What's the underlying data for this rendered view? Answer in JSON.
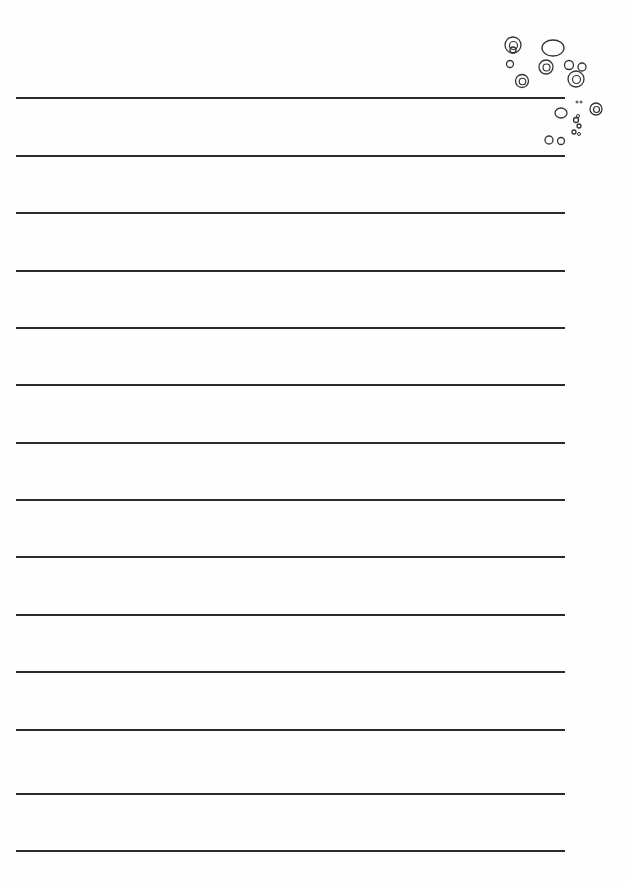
{
  "page": {
    "type": "lined-writing-paper",
    "background_color": "#ffffff",
    "line_color": "#2b2b2b",
    "line_count": 14,
    "line_left": 16,
    "line_right": 565,
    "line_positions_y": [
      98,
      156,
      213,
      271,
      328,
      385,
      443,
      500,
      557,
      615,
      672,
      730,
      794,
      851
    ]
  },
  "decoration": {
    "name": "bubbles-cluster",
    "position": "top-right",
    "stroke_color": "#333333",
    "circles": [
      {
        "cx": 513,
        "cy": 50,
        "r": 3,
        "double": false
      },
      {
        "cx": 513,
        "cy": 45,
        "r": 8,
        "double": true
      },
      {
        "cx": 553,
        "cy": 48,
        "r": 11,
        "ry": 8,
        "double": false
      },
      {
        "cx": 510,
        "cy": 64,
        "r": 3.5,
        "double": false
      },
      {
        "cx": 546,
        "cy": 67,
        "r": 7,
        "double": true
      },
      {
        "cx": 569,
        "cy": 65,
        "r": 4.5,
        "double": false
      },
      {
        "cx": 582,
        "cy": 67,
        "r": 4,
        "double": false
      },
      {
        "cx": 522,
        "cy": 81,
        "r": 6.5,
        "double": true
      },
      {
        "cx": 576,
        "cy": 79,
        "r": 8,
        "double": true
      },
      {
        "cx": 577,
        "cy": 102,
        "r": 1,
        "double": false
      },
      {
        "cx": 581,
        "cy": 102,
        "r": 1,
        "double": false
      },
      {
        "cx": 596,
        "cy": 109,
        "r": 6,
        "double": true
      },
      {
        "cx": 561,
        "cy": 113,
        "r": 6,
        "ry": 5,
        "double": false
      },
      {
        "cx": 576,
        "cy": 120,
        "r": 2.5,
        "double": false
      },
      {
        "cx": 578,
        "cy": 116,
        "r": 1.5,
        "double": false
      },
      {
        "cx": 579,
        "cy": 126,
        "r": 2,
        "double": false
      },
      {
        "cx": 574,
        "cy": 132,
        "r": 2,
        "double": false
      },
      {
        "cx": 579,
        "cy": 134,
        "r": 1.5,
        "double": false
      },
      {
        "cx": 549,
        "cy": 140,
        "r": 4,
        "double": false
      },
      {
        "cx": 561,
        "cy": 141,
        "r": 3.5,
        "double": false
      }
    ]
  }
}
